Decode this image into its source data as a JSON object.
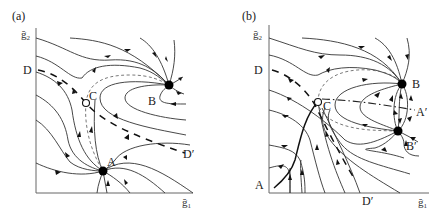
{
  "figure": {
    "panels": [
      {
        "id": "a",
        "label": "(a)",
        "axes": {
          "x_label": "g̃1",
          "y_label": "g̃2",
          "x_sub": "1",
          "y_sub": "2",
          "x_main": "ğ",
          "y_main": "ğ"
        },
        "points": {
          "A": {
            "label": "A",
            "type": "stable node (filled)"
          },
          "B": {
            "label": "B",
            "type": "stable node (filled)"
          },
          "C": {
            "label": "C",
            "type": "saddle (open circle)"
          }
        },
        "separatrix_labels": {
          "start": "D",
          "end": "D′"
        }
      },
      {
        "id": "b",
        "label": "(b)",
        "axes": {
          "x_label": "g̃1",
          "y_label": "g̃2",
          "x_sub": "1",
          "y_sub": "2",
          "x_main": "ğ",
          "y_main": "ğ"
        },
        "points": {
          "A": {
            "label": "A",
            "type": "trajectory start on axis"
          },
          "B": {
            "label": "B",
            "type": "stable node (filled)"
          },
          "Bprime": {
            "label": "B′",
            "type": "stable node (filled)"
          },
          "C": {
            "label": "C",
            "type": "saddle (open circle)"
          },
          "Aprime": {
            "label": "A′",
            "type": "dash-dot separatrix end"
          }
        },
        "separatrix_labels": {
          "start": "D",
          "end": "D′"
        }
      }
    ]
  }
}
